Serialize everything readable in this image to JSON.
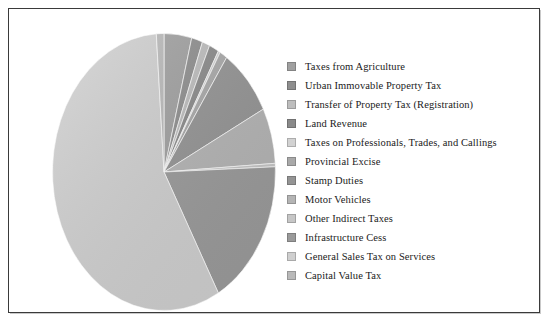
{
  "chart_data": {
    "type": "pie",
    "title": "",
    "xlabel": "",
    "ylabel": "",
    "legend_position": "right",
    "grid": false,
    "categories": [
      "Taxes from Agriculture",
      "Urban Immovable Property Tax",
      "Transfer of Property Tax (Registration)",
      "Land Revenue",
      "Taxes on Professionals, Trades, and Callings",
      "Provincial Excise",
      "Stamp Duties",
      "Motor Vehicles",
      "Other Indirect Taxes",
      "Infrastructure Cess",
      "General Sales Tax on Services",
      "Capital Value Tax"
    ],
    "values": [
      4.0,
      1.6,
      1.1,
      1.4,
      0.3,
      1.1,
      8.0,
      6.5,
      0.4,
      17.5,
      57.0,
      1.1
    ],
    "colors": [
      "#a0a0a0",
      "#8e8e8e",
      "#bdbdbd",
      "#8a8a8a",
      "#d2d2d2",
      "#a9a9a9",
      "#949494",
      "#b4b4b4",
      "#c6c6c6",
      "#9a9a9a",
      "#cfcfcf",
      "#b9b9b9"
    ]
  },
  "legend": {
    "items": [
      {
        "label": "Taxes from Agriculture",
        "color": "#a0a0a0"
      },
      {
        "label": "Urban Immovable Property Tax",
        "color": "#8e8e8e"
      },
      {
        "label": "Transfer of Property Tax (Registration)",
        "color": "#bdbdbd"
      },
      {
        "label": "Land Revenue",
        "color": "#8a8a8a"
      },
      {
        "label": "Taxes on Professionals, Trades, and Callings",
        "color": "#d2d2d2"
      },
      {
        "label": "Provincial Excise",
        "color": "#a9a9a9"
      },
      {
        "label": "Stamp Duties",
        "color": "#949494"
      },
      {
        "label": "Motor Vehicles",
        "color": "#b4b4b4"
      },
      {
        "label": "Other Indirect Taxes",
        "color": "#c6c6c6"
      },
      {
        "label": "Infrastructure Cess",
        "color": "#9a9a9a"
      },
      {
        "label": "General Sales Tax on Services",
        "color": "#cfcfcf"
      },
      {
        "label": "Capital Value Tax",
        "color": "#b9b9b9"
      }
    ]
  }
}
